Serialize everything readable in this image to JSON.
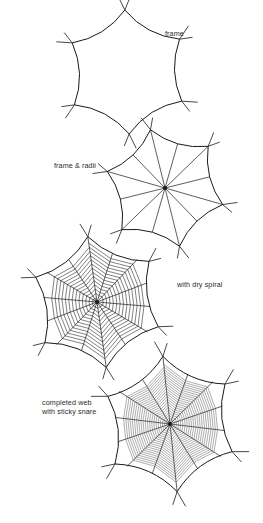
{
  "figure": {
    "title_visible": false,
    "background_color": "#ffffff",
    "ink_color": "#1a1a1a",
    "spiral_color": "#4a4a4a",
    "panels": [
      {
        "id": "panel-frame",
        "label": "frame",
        "label_x": 165,
        "label_y": 30,
        "hub_x": 127,
        "hub_y": 72,
        "radius": 62,
        "vertices": 6,
        "rotation_deg": -92,
        "bow": 0.2,
        "anchor_length": 16,
        "show_radii": false,
        "show_dry_spiral": false,
        "show_sticky_spiral": false,
        "radii_count": 0,
        "dry_turns": 0,
        "sticky_turns": 0
      },
      {
        "id": "panel-frame-radii",
        "label": "frame & radii",
        "label_x": 54,
        "label_y": 162,
        "hub_x": 165,
        "hub_y": 188,
        "radius": 60,
        "vertices": 6,
        "rotation_deg": -104,
        "bow": 0.2,
        "anchor_length": 15,
        "show_radii": true,
        "show_dry_spiral": false,
        "show_sticky_spiral": false,
        "radii_count": 12,
        "dry_turns": 0,
        "sticky_turns": 0
      },
      {
        "id": "panel-dry-spiral",
        "label": "with dry spiral",
        "label_x": 177,
        "label_y": 281,
        "hub_x": 97,
        "hub_y": 302,
        "radius": 66,
        "vertices": 6,
        "rotation_deg": -98,
        "bow": 0.2,
        "anchor_length": 15,
        "show_radii": true,
        "show_dry_spiral": true,
        "show_sticky_spiral": false,
        "radii_count": 14,
        "dry_turns": 13,
        "sticky_turns": 0
      },
      {
        "id": "panel-completed-web",
        "label": "completed web\nwith sticky snare",
        "label_line_1": "completed web",
        "label_line_2": "with sticky snare",
        "label_x": 42,
        "label_y": 399,
        "hub_x": 170,
        "hub_y": 424,
        "radius": 68,
        "vertices": 6,
        "rotation_deg": -96,
        "bow": 0.2,
        "anchor_length": 17,
        "show_radii": true,
        "show_dry_spiral": false,
        "show_sticky_spiral": true,
        "radii_count": 14,
        "dry_turns": 0,
        "sticky_turns": 21
      }
    ]
  }
}
